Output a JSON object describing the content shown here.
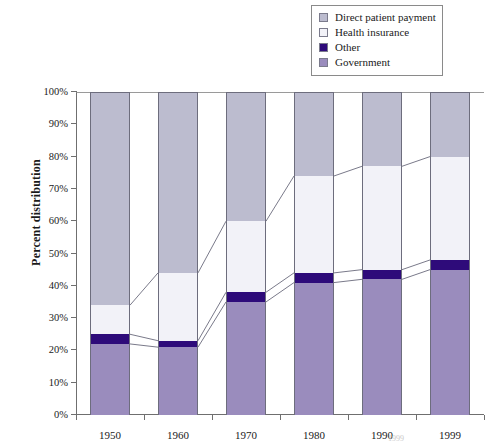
{
  "chart_data": {
    "type": "bar",
    "subtype": "stacked-100-percent",
    "title": "",
    "xlabel": "",
    "ylabel": "Percent distribution",
    "categories": [
      "1950",
      "1960",
      "1970",
      "1980",
      "1990",
      "1999"
    ],
    "ylim": [
      0,
      100
    ],
    "ytick_labels": [
      "0%",
      "10%",
      "20%",
      "30%",
      "40%",
      "50%",
      "60%",
      "70%",
      "80%",
      "90%",
      "100%"
    ],
    "ytick_values": [
      0,
      10,
      20,
      30,
      40,
      50,
      60,
      70,
      80,
      90,
      100
    ],
    "grid": false,
    "legend_position": "top-right",
    "stack_order_bottom_to_top": [
      "Government",
      "Other",
      "Health insurance",
      "Direct patient payment"
    ],
    "series": [
      {
        "name": "Government",
        "values": [
          22,
          21,
          35,
          41,
          42,
          45
        ]
      },
      {
        "name": "Other",
        "values": [
          3,
          2,
          3,
          3,
          3,
          3
        ]
      },
      {
        "name": "Health insurance",
        "values": [
          9,
          21,
          22,
          30,
          32,
          32
        ]
      },
      {
        "name": "Direct patient payment",
        "values": [
          66,
          56,
          40,
          26,
          23,
          20
        ]
      }
    ],
    "connector_lines": true
  },
  "legend": {
    "items": [
      {
        "label": "Direct patient payment",
        "color": "#bcbccf"
      },
      {
        "label": "Health insurance",
        "color": "#f2f2f8"
      },
      {
        "label": "Other",
        "color": "#2e0b7a"
      },
      {
        "label": "Government",
        "color": "#9a8cbd"
      }
    ]
  },
  "colors": {
    "direct_patient_payment": "#bcbccf",
    "health_insurance": "#f2f2f8",
    "other": "#2e0b7a",
    "government": "#9a8cbd",
    "axis": "#6f6f6f",
    "segment_border": "#6d6d7d",
    "connector": "#7a7a8a"
  },
  "footer": {
    "partial_text": "1999"
  }
}
